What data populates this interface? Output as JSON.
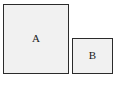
{
  "figure": {
    "background_color": "#ffffff",
    "shapes": [
      {
        "name": "square-a",
        "label": "A",
        "fill_color": "#f1f1f1",
        "border_color": "#2b2b2b",
        "x": 3,
        "y": 4,
        "width": 66,
        "height": 70
      },
      {
        "name": "square-b",
        "label": "B",
        "fill_color": "#f1f1f1",
        "border_color": "#2b2b2b",
        "x": 72,
        "y": 38,
        "width": 41,
        "height": 36
      }
    ]
  }
}
